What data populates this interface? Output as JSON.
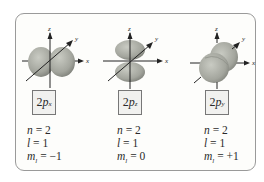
{
  "figure": {
    "orbitals": [
      {
        "id": "2px",
        "label_number": "2",
        "label_letter": "p",
        "label_subscript": "x",
        "n_label": "n",
        "n_value": "= 2",
        "l_label": "l",
        "l_value": "= 1",
        "ml_label": "m",
        "ml_subscript": "l",
        "ml_value": "= −1",
        "axes": {
          "z": "z",
          "y": "y",
          "x": "x"
        }
      },
      {
        "id": "2pz",
        "label_number": "2",
        "label_letter": "p",
        "label_subscript": "z",
        "n_label": "n",
        "n_value": "= 2",
        "l_label": "l",
        "l_value": "= 1",
        "ml_label": "m",
        "ml_subscript": "l",
        "ml_value": "= 0",
        "axes": {
          "z": "z",
          "y": "y",
          "x": "x"
        }
      },
      {
        "id": "2py",
        "label_number": "2",
        "label_letter": "p",
        "label_subscript": "y",
        "n_label": "n",
        "n_value": "= 2",
        "l_label": "l",
        "l_value": "= 1",
        "ml_label": "m",
        "ml_subscript": "l",
        "ml_value": "= +1",
        "axes": {
          "z": "z",
          "y": "y",
          "x": "x"
        }
      }
    ],
    "colors": {
      "lobe_fill": "#a9aba3",
      "lobe_shadow": "#7d7f78",
      "axis": "#222222",
      "border": "#9a9a9a",
      "label_bg": "#f1f1ef"
    }
  }
}
